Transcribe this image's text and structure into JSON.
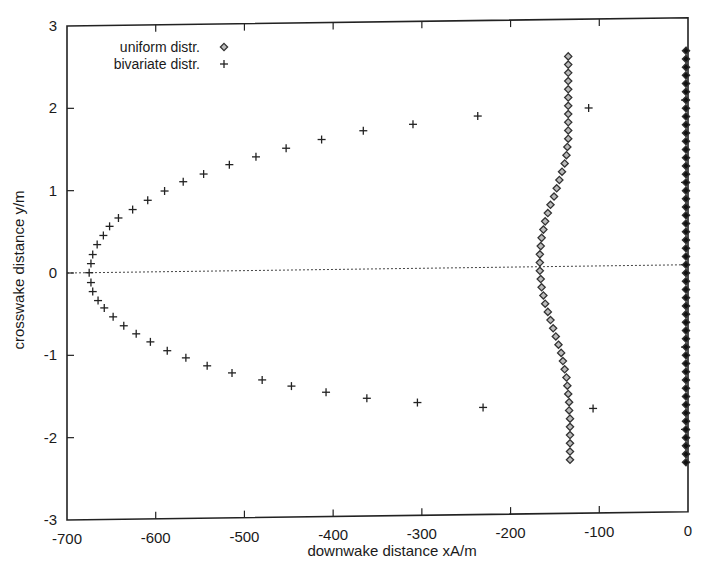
{
  "chart_data": {
    "type": "scatter",
    "title": "",
    "xlabel": "downwake distance xA/m",
    "ylabel": "crosswake distance y/m",
    "xlim": [
      -700,
      0
    ],
    "ylim": [
      -3,
      3
    ],
    "x_ticks": [
      -700,
      -600,
      -500,
      -400,
      -300,
      -200,
      -100,
      0
    ],
    "y_ticks": [
      -3,
      -2,
      -1,
      0,
      1,
      2,
      3
    ],
    "x_tick_labels": [
      "-700",
      "-600",
      "-500",
      "-400",
      "-300",
      "-200",
      "-100",
      "0"
    ],
    "y_tick_labels": [
      "-3",
      "-2",
      "-1",
      "0",
      "1",
      "2",
      "3"
    ],
    "grid": false,
    "zero_line": {
      "y": 0,
      "style": "dotted"
    },
    "legend": {
      "position": "upper-left",
      "entries": [
        {
          "label": "uniform distr.",
          "marker": "diamond-open"
        },
        {
          "label": "bivariate distr.",
          "marker": "plus"
        }
      ]
    },
    "series": [
      {
        "name": "uniform distr.",
        "marker": "diamond-open",
        "points": [
          [
            -135,
            2.55
          ],
          [
            -135,
            2.45
          ],
          [
            -135,
            2.35
          ],
          [
            -135,
            2.25
          ],
          [
            -135,
            2.15
          ],
          [
            -135,
            2.05
          ],
          [
            -135,
            1.95
          ],
          [
            -135,
            1.85
          ],
          [
            -135,
            1.75
          ],
          [
            -135,
            1.65
          ],
          [
            -135,
            1.55
          ],
          [
            -136,
            1.45
          ],
          [
            -137,
            1.35
          ],
          [
            -139,
            1.25
          ],
          [
            -142,
            1.15
          ],
          [
            -145,
            1.05
          ],
          [
            -148,
            0.95
          ],
          [
            -151,
            0.85
          ],
          [
            -155,
            0.75
          ],
          [
            -158,
            0.65
          ],
          [
            -161,
            0.55
          ],
          [
            -163,
            0.45
          ],
          [
            -165,
            0.35
          ],
          [
            -166,
            0.25
          ],
          [
            -167,
            0.15
          ],
          [
            -167,
            0.05
          ],
          [
            -167,
            -0.05
          ],
          [
            -166,
            -0.15
          ],
          [
            -165,
            -0.25
          ],
          [
            -163,
            -0.35
          ],
          [
            -161,
            -0.45
          ],
          [
            -158,
            -0.55
          ],
          [
            -155,
            -0.65
          ],
          [
            -152,
            -0.75
          ],
          [
            -149,
            -0.85
          ],
          [
            -146,
            -0.95
          ],
          [
            -143,
            -1.05
          ],
          [
            -141,
            -1.15
          ],
          [
            -139,
            -1.25
          ],
          [
            -137,
            -1.35
          ],
          [
            -136,
            -1.45
          ],
          [
            -135,
            -1.55
          ],
          [
            -134,
            -1.65
          ],
          [
            -134,
            -1.75
          ],
          [
            -133,
            -1.85
          ],
          [
            -133,
            -1.95
          ],
          [
            -133,
            -2.05
          ],
          [
            -133,
            -2.15
          ],
          [
            -133,
            -2.25
          ],
          [
            -133,
            -2.35
          ]
        ]
      },
      {
        "name": "bivariate distr.",
        "marker": "plus",
        "points": [
          [
            -112,
            1.92
          ],
          [
            -237,
            1.84
          ],
          [
            -310,
            1.75
          ],
          [
            -366,
            1.68
          ],
          [
            -413,
            1.58
          ],
          [
            -453,
            1.48
          ],
          [
            -487,
            1.38
          ],
          [
            -517,
            1.29
          ],
          [
            -546,
            1.18
          ],
          [
            -569,
            1.09
          ],
          [
            -590,
            0.98
          ],
          [
            -609,
            0.87
          ],
          [
            -626,
            0.76
          ],
          [
            -642,
            0.66
          ],
          [
            -652,
            0.56
          ],
          [
            -659,
            0.45
          ],
          [
            -666,
            0.34
          ],
          [
            -671,
            0.22
          ],
          [
            -673,
            0.11
          ],
          [
            -675,
            0.0
          ],
          [
            -673,
            -0.12
          ],
          [
            -671,
            -0.23
          ],
          [
            -665,
            -0.34
          ],
          [
            -658,
            -0.43
          ],
          [
            -648,
            -0.54
          ],
          [
            -636,
            -0.65
          ],
          [
            -622,
            -0.75
          ],
          [
            -606,
            -0.85
          ],
          [
            -587,
            -0.96
          ],
          [
            -566,
            -1.05
          ],
          [
            -542,
            -1.15
          ],
          [
            -514,
            -1.24
          ],
          [
            -480,
            -1.33
          ],
          [
            -447,
            -1.41
          ],
          [
            -408,
            -1.49
          ],
          [
            -362,
            -1.57
          ],
          [
            -305,
            -1.63
          ],
          [
            -231,
            -1.7
          ],
          [
            -107,
            -1.73
          ]
        ]
      },
      {
        "name": "filled diamonds at x=0 (unlabeled)",
        "marker": "diamond-filled",
        "points_x": 0,
        "y_range": [
          -2.4,
          2.6
        ],
        "count": 51
      }
    ]
  }
}
